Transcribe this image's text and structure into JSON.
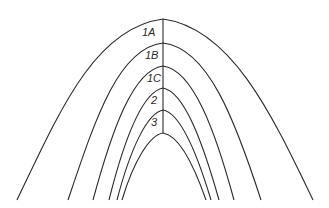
{
  "diagram": {
    "type": "nested parabolic zones",
    "stroke_color": "#2a2a2a",
    "background": "#ffffff",
    "zones": [
      {
        "label": "1A"
      },
      {
        "label": "1B"
      },
      {
        "label": "1C"
      },
      {
        "label": "2"
      },
      {
        "label": "3"
      },
      {
        "label": ""
      }
    ]
  }
}
